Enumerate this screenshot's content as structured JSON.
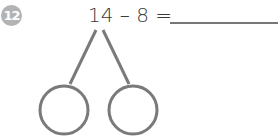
{
  "problem": {
    "number": "12",
    "equation": "14 – 8 =",
    "answer_blank": ""
  },
  "number_bond": {
    "stroke_color": "#7a7a7a",
    "parts": [
      "",
      ""
    ]
  },
  "colors": {
    "badge": "#b3b3b3",
    "text": "#3a3a3a"
  }
}
